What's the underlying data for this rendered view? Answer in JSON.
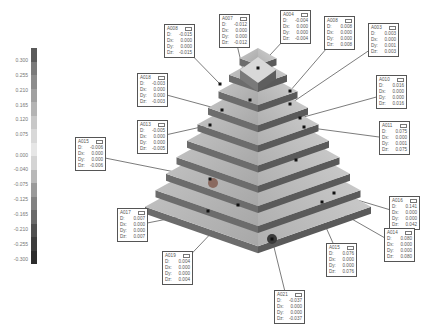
{
  "legend": {
    "ticks": [
      "0.300",
      "0.255",
      "0.210",
      "0.165",
      "0.120",
      "0.075",
      "0.000",
      "-0.040",
      "-0.075",
      "-0.125",
      "-0.165",
      "-0.210",
      "-0.255",
      "-0.300"
    ],
    "colors": [
      "#5a5a5a",
      "#7a7a7a",
      "#8c8c8c",
      "#a0a0a0",
      "#b4b4b4",
      "#c8c8c8",
      "#d8d8d8",
      "#e6e6e6",
      "#d4d4d4",
      "#b8b8b8",
      "#9a9a9a",
      "#828282",
      "#6a6a6a",
      "#505050",
      "#3c3c3c",
      "#2c2c2c"
    ]
  },
  "callouts": [
    {
      "id": "A008",
      "x": 164,
      "y": 24,
      "rows": [
        [
          "D:",
          "-0.015"
        ],
        [
          "Dx:",
          "0.000"
        ],
        [
          "Dy:",
          "0.000"
        ],
        [
          "Dz:",
          "-0.015"
        ]
      ]
    },
    {
      "id": "A007",
      "x": 219,
      "y": 14,
      "rows": [
        [
          "D:",
          "-0.012"
        ],
        [
          "Dx:",
          "0.000"
        ],
        [
          "Dy:",
          "0.000"
        ],
        [
          "Dz:",
          "-0.012"
        ]
      ]
    },
    {
      "id": "A004",
      "x": 280,
      "y": 10,
      "rows": [
        [
          "D:",
          "-0.004"
        ],
        [
          "Dx:",
          "0.000"
        ],
        [
          "Dy:",
          "0.000"
        ],
        [
          "Dz:",
          "-0.004"
        ]
      ]
    },
    {
      "id": "A008",
      "x": 324,
      "y": 16,
      "rows": [
        [
          "D:",
          "0.008"
        ],
        [
          "Dx:",
          "0.000"
        ],
        [
          "Dy:",
          "0.000"
        ],
        [
          "Dz:",
          "0.008"
        ]
      ]
    },
    {
      "id": "A003",
      "x": 368,
      "y": 23,
      "rows": [
        [
          "D:",
          "0.003"
        ],
        [
          "Dx:",
          "0.000"
        ],
        [
          "Dy:",
          "0.001"
        ],
        [
          "Dz:",
          "0.003"
        ]
      ]
    },
    {
      "id": "A018",
      "x": 137,
      "y": 73,
      "rows": [
        [
          "D:",
          "-0.003"
        ],
        [
          "Dx:",
          "0.000"
        ],
        [
          "Dy:",
          "0.000"
        ],
        [
          "Dz:",
          "-0.003"
        ]
      ]
    },
    {
      "id": "A010",
      "x": 376,
      "y": 75,
      "rows": [
        [
          "D:",
          "0.016"
        ],
        [
          "Dx:",
          "0.000"
        ],
        [
          "Dy:",
          "0.000"
        ],
        [
          "Dz:",
          "0.016"
        ]
      ]
    },
    {
      "id": "A013",
      "x": 137,
      "y": 120,
      "rows": [
        [
          "D:",
          "-0.005"
        ],
        [
          "Dx:",
          "0.000"
        ],
        [
          "Dy:",
          "0.000"
        ],
        [
          "Dz:",
          "-0.005"
        ]
      ]
    },
    {
      "id": "A011",
      "x": 379,
      "y": 121,
      "rows": [
        [
          "D:",
          "0.075"
        ],
        [
          "Dx:",
          "0.000"
        ],
        [
          "Dy:",
          "0.001"
        ],
        [
          "Dz:",
          "0.075"
        ]
      ]
    },
    {
      "id": "A015",
      "x": 75,
      "y": 137,
      "rows": [
        [
          "D:",
          "-0.006"
        ],
        [
          "Dx:",
          "0.000"
        ],
        [
          "Dy:",
          "0.000"
        ],
        [
          "Dz:",
          "-0.006"
        ]
      ]
    },
    {
      "id": "A017",
      "x": 117,
      "y": 208,
      "rows": [
        [
          "D:",
          "0.007"
        ],
        [
          "Dx:",
          "0.000"
        ],
        [
          "Dy:",
          "0.000"
        ],
        [
          "Dz:",
          "0.007"
        ]
      ]
    },
    {
      "id": "A016",
      "x": 389,
      "y": 196,
      "rows": [
        [
          "D:",
          "0.141"
        ],
        [
          "Dx:",
          "0.000"
        ],
        [
          "Dy:",
          "0.000"
        ],
        [
          "Dz:",
          "0.042"
        ]
      ]
    },
    {
      "id": "A014",
      "x": 384,
      "y": 228,
      "rows": [
        [
          "D:",
          "0.080"
        ],
        [
          "Dx:",
          "0.000"
        ],
        [
          "Dy:",
          "0.000"
        ],
        [
          "Dz:",
          "0.080"
        ]
      ]
    },
    {
      "id": "A019",
      "x": 162,
      "y": 251,
      "rows": [
        [
          "D:",
          "0.004"
        ],
        [
          "Dx:",
          "0.000"
        ],
        [
          "Dy:",
          "0.000"
        ],
        [
          "Dz:",
          "0.004"
        ]
      ]
    },
    {
      "id": "A015",
      "x": 326,
      "y": 243,
      "rows": [
        [
          "D:",
          "0.076"
        ],
        [
          "Dx:",
          "0.000"
        ],
        [
          "Dy:",
          "0.000"
        ],
        [
          "Dz:",
          "0.076"
        ]
      ]
    },
    {
      "id": "A021",
      "x": 274,
      "y": 290,
      "rows": [
        [
          "D:",
          "-0.037"
        ],
        [
          "Dx:",
          "0.000"
        ],
        [
          "Dy:",
          "0.000"
        ],
        [
          "Dz:",
          "-0.037"
        ]
      ]
    }
  ]
}
